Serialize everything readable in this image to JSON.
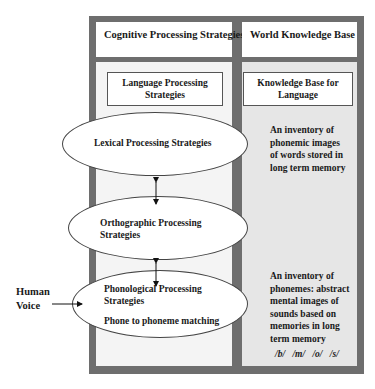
{
  "headers": {
    "left": "Cognitive Processing Strategies",
    "right": "World Knowledge Base"
  },
  "subheaders": {
    "left_line1": "Language Processing",
    "left_line2": "Strategies",
    "right_line1": "Knowledge Base for",
    "right_line2": "Language"
  },
  "ellipses": {
    "lexical": "Lexical Processing Strategies",
    "orthographic_line1": "Orthographic Processing",
    "orthographic_line2": "Strategies",
    "phonological_line1": "Phonological Processing",
    "phonological_line2": "Strategies",
    "phonological_line3": "Phone to phoneme matching"
  },
  "knowledge": {
    "words": [
      "An inventory of",
      "phonemic images",
      "of words stored in",
      "long term memory"
    ],
    "phonemes": [
      "An inventory of",
      "phonemes: abstract",
      "mental images of",
      "sounds based on",
      "memories in long",
      "term memory"
    ],
    "phoneme_examples": "/b/ /m/ /o/ /s/"
  },
  "input": {
    "line1": "Human",
    "line2": "Voice"
  }
}
